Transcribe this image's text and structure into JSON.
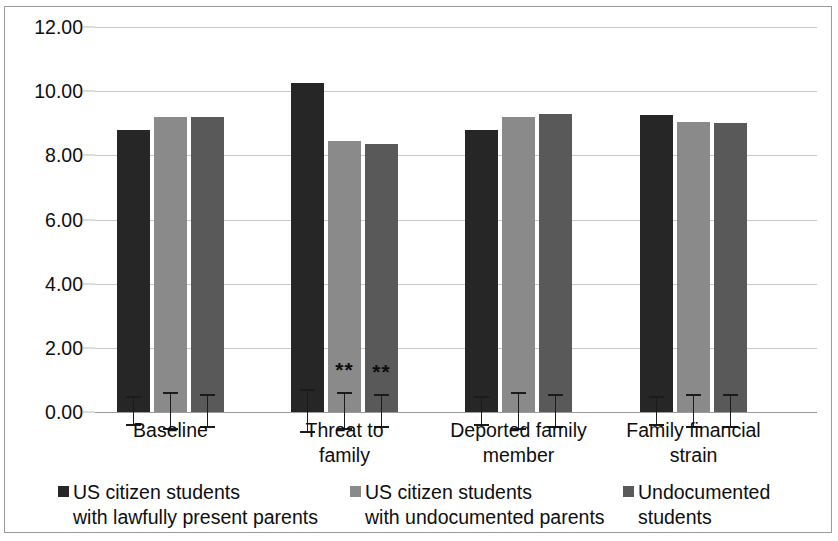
{
  "chart_data": {
    "type": "bar",
    "title": "",
    "subtitle": "",
    "xlabel": "",
    "ylabel": "",
    "ylim": [
      0,
      12
    ],
    "ytick_step": 2,
    "ytick_labels": [
      "0.00",
      "2.00",
      "4.00",
      "6.00",
      "8.00",
      "10.00",
      "12.00"
    ],
    "ytick_values": [
      0,
      2,
      4,
      6,
      8,
      10,
      12
    ],
    "grid": true,
    "grid_axis": "y",
    "legend_position": "bottom",
    "categories": [
      "Baseline",
      "Threat to family",
      "Deported family member",
      "Family financial strain"
    ],
    "category_lines": [
      [
        "Baseline"
      ],
      [
        "Threat to",
        "family"
      ],
      [
        "Deported family",
        "member"
      ],
      [
        "Family financial",
        "strain"
      ]
    ],
    "series": [
      {
        "name": "US citizen students with lawfully present parents",
        "name_lines": [
          "US citizen students",
          "with lawfully present parents"
        ],
        "color": "#262626",
        "values": [
          8.8,
          10.25,
          8.8,
          9.25
        ],
        "errors": [
          0.45,
          0.65,
          0.45,
          0.45
        ],
        "significance": [
          "",
          "",
          "",
          ""
        ]
      },
      {
        "name": "US citizen students with undocumented parents",
        "name_lines": [
          "US citizen students",
          "with undocumented parents"
        ],
        "color": "#8a8a8a",
        "values": [
          9.2,
          8.45,
          9.2,
          9.05
        ],
        "errors": [
          0.55,
          0.55,
          0.55,
          0.5
        ],
        "significance": [
          "",
          "**",
          "",
          ""
        ]
      },
      {
        "name": "Undocumented students",
        "name_lines": [
          "Undocumented",
          "students"
        ],
        "color": "#595959",
        "values": [
          9.2,
          8.35,
          9.3,
          9.0
        ],
        "errors": [
          0.5,
          0.5,
          0.5,
          0.5
        ],
        "significance": [
          "",
          "**",
          "",
          ""
        ]
      }
    ],
    "significance_note": "**"
  },
  "legend": {
    "items": [
      {
        "label": "US citizen students\nwith lawfully present parents",
        "color": "#262626"
      },
      {
        "label": "US citizen students\nwith undocumented parents",
        "color": "#8a8a8a"
      },
      {
        "label": "Undocumented\nstudents",
        "color": "#595959"
      }
    ]
  }
}
